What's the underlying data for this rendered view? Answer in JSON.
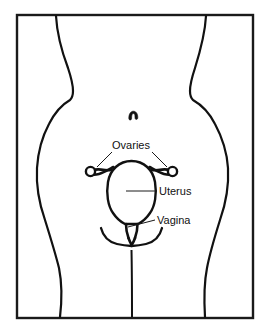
{
  "figure": {
    "background_color": "#ffffff",
    "ink_color": "#111111",
    "frame": {
      "name": "diagram-border",
      "stroke_color": "#1a1a1a",
      "x": 17,
      "y": 15,
      "width": 236,
      "height": 303
    }
  },
  "labels": [
    {
      "id": "ovaries",
      "text": "Ovaries",
      "x": 131,
      "y": 149,
      "anchor": "middle",
      "leaders": 2
    },
    {
      "id": "uterus",
      "text": "Uterus",
      "x": 159,
      "y": 195,
      "anchor": "start",
      "leaders": 1
    },
    {
      "id": "vagina",
      "text": "Vagina",
      "x": 157,
      "y": 224,
      "anchor": "start",
      "leaders": 1
    }
  ],
  "anatomy_parts": [
    {
      "id": "torso-outline",
      "name": "Lower torso and hips outline"
    },
    {
      "id": "navel",
      "name": "Navel"
    },
    {
      "id": "left-ovary",
      "name": "Left ovary"
    },
    {
      "id": "right-ovary",
      "name": "Right ovary"
    },
    {
      "id": "left-fallopian-tube",
      "name": "Left fallopian tube"
    },
    {
      "id": "right-fallopian-tube",
      "name": "Right fallopian tube"
    },
    {
      "id": "uterus-body",
      "name": "Uterus"
    },
    {
      "id": "cervix",
      "name": "Cervix"
    },
    {
      "id": "vagina-canal",
      "name": "Vagina"
    },
    {
      "id": "vulva",
      "name": "Vulva / labia"
    },
    {
      "id": "leg-cleft",
      "name": "Leg cleft line"
    }
  ]
}
